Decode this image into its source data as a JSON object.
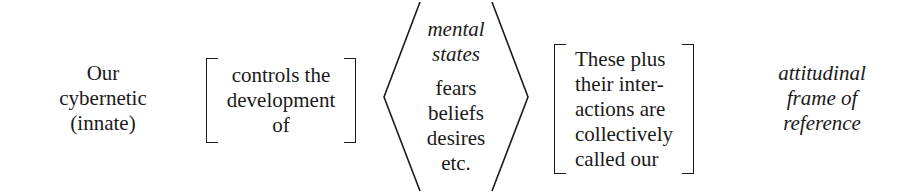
{
  "figure": {
    "type": "typographic-diagram",
    "background_color": "#ffffff",
    "text_color": "#1a1a1a",
    "groups": [
      {
        "id": "subject",
        "bracket": "none",
        "align": "center",
        "lines": [
          "Our",
          "cybernetic",
          "(innate)"
        ]
      },
      {
        "id": "controls",
        "bracket": "square",
        "align": "center",
        "lines": [
          "controls the",
          "development",
          "of"
        ]
      },
      {
        "id": "mental",
        "bracket": "angle",
        "align": "center",
        "head_lines": [
          "mental",
          "states"
        ],
        "lines": [
          "fears",
          "beliefs",
          "desires",
          "etc."
        ]
      },
      {
        "id": "collective",
        "bracket": "square",
        "align": "left",
        "lines": [
          "These plus",
          "their inter-",
          "actions are",
          "collectively",
          "called our"
        ]
      },
      {
        "id": "frame",
        "bracket": "none",
        "align": "center",
        "style": "italic",
        "lines": [
          "attitudinal",
          "frame of",
          "reference"
        ]
      }
    ]
  },
  "subject": {
    "line1": "Our",
    "line2": "cybernetic",
    "line3": "(innate)"
  },
  "controls": {
    "line1": "controls the",
    "line2": "development",
    "line3": "of"
  },
  "mental": {
    "head1": "mental",
    "head2": "states",
    "line1": "fears",
    "line2": "beliefs",
    "line3": "desires",
    "line4": "etc."
  },
  "collective": {
    "line1": "These plus",
    "line2": "their inter-",
    "line3": "actions are",
    "line4": "collectively",
    "line5": "called our"
  },
  "frame": {
    "line1": "attitudinal",
    "line2": "frame of",
    "line3": "reference"
  }
}
